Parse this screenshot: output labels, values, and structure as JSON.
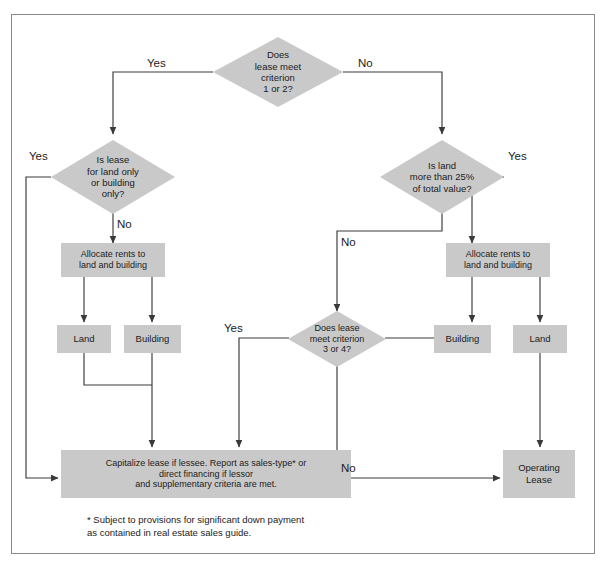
{
  "diagram": {
    "colors": {
      "node_fill": "#c9c9c9",
      "line": "#3a3a3a",
      "frame": "#8a8a8a",
      "text": "#1b1b1b",
      "background": "#ffffff"
    },
    "nodes": {
      "d_criterion_1_2": {
        "type": "decision",
        "label": "Does\nlease meet\ncriterion\n1 or 2?"
      },
      "d_land_or_building_only": {
        "type": "decision",
        "label": "Is lease\nfor land only\nor building\nonly?"
      },
      "d_land_more_25": {
        "type": "decision",
        "label": "Is land\nmore than 25%\nof total value?"
      },
      "d_criterion_3_4": {
        "type": "decision",
        "label": "Does lease\nmeet criterion\n3 or 4?"
      },
      "p_allocate_left": {
        "type": "process",
        "label": "Allocate rents to\nland and building"
      },
      "p_allocate_right": {
        "type": "process",
        "label": "Allocate rents to\nland and building"
      },
      "p_land_left": {
        "type": "process",
        "label": "Land"
      },
      "p_building_left": {
        "type": "process",
        "label": "Building"
      },
      "p_building_right": {
        "type": "process",
        "label": "Building"
      },
      "p_land_right": {
        "type": "process",
        "label": "Land"
      },
      "p_capitalize": {
        "type": "terminal",
        "label": "Capitalize lease if lessee. Report as sales-type* or\ndirect financing if lessor\nand supplementary criteria are met."
      },
      "p_operating_lease": {
        "type": "terminal",
        "label": "Operating\nLease"
      }
    },
    "edge_labels": {
      "yes_from_criterion_1_2": "Yes",
      "no_from_criterion_1_2": "No",
      "yes_from_land_or_building_only": "Yes",
      "no_from_land_or_building_only": "No",
      "yes_from_land_more_25": "Yes",
      "no_from_land_more_25": "No",
      "yes_from_criterion_3_4": "Yes",
      "no_from_criterion_3_4": "No"
    },
    "footnote": "* Subject to provisions for significant down payment\n   as contained in real estate sales guide."
  }
}
